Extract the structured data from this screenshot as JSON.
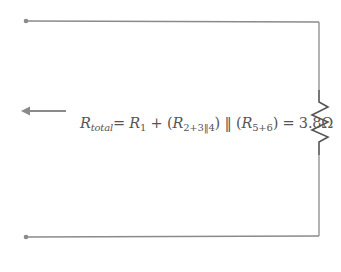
{
  "diagram": {
    "type": "circuit",
    "formula": {
      "lhs_symbol": "R",
      "lhs_sub": "total",
      "eq": "= ",
      "r1_symbol": "R",
      "r1_sub": "1",
      "plus": " + (",
      "r234_symbol": "R",
      "r234_sub": "2+3‖4",
      "parallel": ") ‖ (",
      "r56_symbol": "R",
      "r56_sub": "5+6",
      "result": ") = 3.8Ω"
    },
    "components": {
      "resistor": "equivalent-resistor",
      "arrow": "left-arrow",
      "terminals": [
        "top-left-terminal",
        "bottom-left-terminal"
      ]
    },
    "colors": {
      "wire": "#8a8a8a",
      "text": "#555555",
      "resistor": "#555555"
    }
  }
}
